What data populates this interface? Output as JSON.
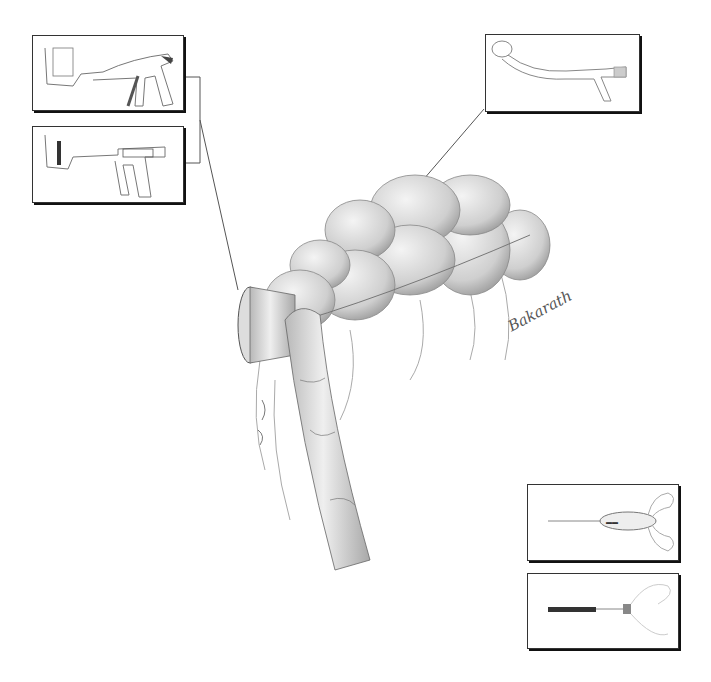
{
  "figure": {
    "signature": "Bakarath",
    "panels": [
      {
        "id": "linear-stapler-top",
        "label": "linear stapler"
      },
      {
        "id": "linear-stapler-bottom",
        "label": "linear stapler with handle"
      },
      {
        "id": "curved-circular-stapler",
        "label": "curved circular stapler"
      },
      {
        "id": "scissor-instrument",
        "label": "scissor-grip instrument"
      },
      {
        "id": "purse-string-instrument",
        "label": "purse-string instrument"
      }
    ],
    "colors": {
      "line": "#333333",
      "shade": "#bdbdbd",
      "background": "#ffffff"
    }
  }
}
